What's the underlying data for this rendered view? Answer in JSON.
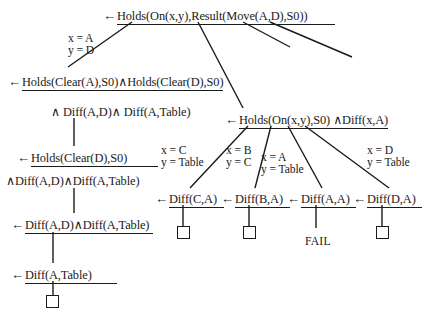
{
  "diagram": {
    "type": "slrd-proof-tree",
    "title": "",
    "nodes": [
      {
        "id": "root",
        "arrow": "←",
        "text": "Holds(On(x,y),Result(Move(A,D),S0))",
        "underlined": true,
        "x": 103,
        "y": 9,
        "underline_width": 218
      },
      {
        "id": "n2",
        "arrow": "←",
        "text": "Holds(Clear(A),S0)∧Holds(Clear(D),S0)",
        "underlined": true,
        "x": 8,
        "y": 75,
        "underline_width": 116
      },
      {
        "id": "n2b",
        "arrow": "",
        "text": "∧ Diff(A,D)∧ Diff(A,Table)",
        "underlined": false,
        "x": 51,
        "y": 106,
        "underline_width": 0
      },
      {
        "id": "n3",
        "arrow": "←",
        "text": "Holds(On(x,y),S0) ∧Diff(x,A)",
        "underlined": true,
        "x": 225,
        "y": 113,
        "underline_width": 108
      },
      {
        "id": "n4",
        "arrow": "←",
        "text": "Holds(Clear(D),S0)",
        "underlined": true,
        "x": 17,
        "y": 151,
        "underline_width": 127
      },
      {
        "id": "n4b",
        "arrow": "",
        "text": "∧Diff(A,D)∧Diff(A,Table)",
        "underlined": false,
        "x": 6,
        "y": 175,
        "underline_width": 0
      },
      {
        "id": "n5",
        "arrow": "←",
        "text": "Diff(A,D)∧Diff(A,Table)",
        "underlined": true,
        "x": 11,
        "y": 218,
        "underline_width": 128
      },
      {
        "id": "n6",
        "arrow": "←",
        "text": "Diff(A,Table)",
        "underlined": true,
        "x": 11,
        "y": 268,
        "underline_width": 92
      },
      {
        "id": "leaf-c",
        "arrow": "←",
        "text": "Diff(C,A)",
        "underlined": true,
        "x": 155,
        "y": 192,
        "underline_width": 55
      },
      {
        "id": "leaf-b",
        "arrow": "←",
        "text": "Diff(B,A)",
        "underlined": true,
        "x": 221,
        "y": 192,
        "underline_width": 55
      },
      {
        "id": "leaf-a",
        "arrow": "←",
        "text": "Diff(A,A)",
        "underlined": true,
        "x": 287,
        "y": 192,
        "underline_width": 55
      },
      {
        "id": "leaf-d",
        "arrow": "←",
        "text": "Diff(D,A)",
        "underlined": true,
        "x": 353,
        "y": 192,
        "underline_width": 55
      }
    ],
    "substitution_labels": [
      {
        "id": "sub-root",
        "lines": [
          "x = A",
          "y = D"
        ],
        "x": 68,
        "y": 33
      },
      {
        "id": "sub-c",
        "lines": [
          "x = C",
          "y = Table"
        ],
        "x": 161,
        "y": 145
      },
      {
        "id": "sub-b",
        "lines": [
          "x = B",
          "y = C"
        ],
        "x": 226,
        "y": 145
      },
      {
        "id": "sub-a",
        "lines": [
          "x = A",
          "y = Table"
        ],
        "x": 261,
        "y": 152
      },
      {
        "id": "sub-d",
        "lines": [
          "x = D",
          "y = Table"
        ],
        "x": 367,
        "y": 145
      }
    ],
    "fail_label": {
      "text": "FAIL",
      "x": 305,
      "y": 235
    },
    "empty_boxes": [
      {
        "id": "box-left",
        "x": 46,
        "y": 295
      },
      {
        "id": "box-c",
        "x": 177,
        "y": 226
      },
      {
        "id": "box-b",
        "x": 243,
        "y": 226
      },
      {
        "id": "box-d",
        "x": 376,
        "y": 226
      }
    ],
    "edges": [
      {
        "id": "e-root-left",
        "x1": 132,
        "y1": 22,
        "x2": 68,
        "y2": 67
      },
      {
        "id": "e-root-mid",
        "x1": 198,
        "y1": 22,
        "x2": 243,
        "y2": 108
      },
      {
        "id": "e-root-r1",
        "x1": 243,
        "y1": 22,
        "x2": 290,
        "y2": 47
      },
      {
        "id": "e-root-r2",
        "x1": 270,
        "y1": 22,
        "x2": 352,
        "y2": 57
      },
      {
        "id": "e-n2-n4",
        "x1": 74,
        "y1": 118,
        "x2": 74,
        "y2": 146
      },
      {
        "id": "e-n4-n5",
        "x1": 74,
        "y1": 188,
        "x2": 74,
        "y2": 213
      },
      {
        "id": "e-n5-n6",
        "x1": 53,
        "y1": 232,
        "x2": 53,
        "y2": 263
      },
      {
        "id": "e-n6-box",
        "x1": 53,
        "y1": 281,
        "x2": 53,
        "y2": 295
      },
      {
        "id": "e-n3-c",
        "x1": 248,
        "y1": 126,
        "x2": 190,
        "y2": 188
      },
      {
        "id": "e-n3-b",
        "x1": 271,
        "y1": 126,
        "x2": 255,
        "y2": 188
      },
      {
        "id": "e-n3-a",
        "x1": 288,
        "y1": 126,
        "x2": 322,
        "y2": 188
      },
      {
        "id": "e-n3-d",
        "x1": 305,
        "y1": 126,
        "x2": 389,
        "y2": 188
      },
      {
        "id": "e-c-box",
        "x1": 183,
        "y1": 205,
        "x2": 183,
        "y2": 226
      },
      {
        "id": "e-b-box",
        "x1": 249,
        "y1": 205,
        "x2": 249,
        "y2": 226
      },
      {
        "id": "e-a-fail",
        "x1": 316,
        "y1": 205,
        "x2": 316,
        "y2": 228
      },
      {
        "id": "e-d-box",
        "x1": 382,
        "y1": 205,
        "x2": 382,
        "y2": 226
      }
    ]
  },
  "colors": {
    "ink": "#1a1a1a",
    "background": "#ffffff"
  }
}
